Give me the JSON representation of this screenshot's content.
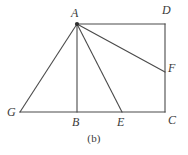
{
  "figure": {
    "caption": "(b)",
    "type": "geometry-diagram",
    "background_color": "#ffffff",
    "stroke_color": "#4a4a4a",
    "label_color": "#3a3a3a",
    "points": {
      "A": {
        "label": "A",
        "x": 77,
        "y": 24,
        "marked": true
      },
      "B": {
        "label": "B",
        "x": 77,
        "y": 112,
        "marked": false
      },
      "C": {
        "label": "C",
        "x": 165,
        "y": 112,
        "marked": false
      },
      "D": {
        "label": "D",
        "x": 165,
        "y": 24,
        "marked": false
      },
      "E": {
        "label": "E",
        "x": 122,
        "y": 112,
        "marked": false
      },
      "F": {
        "label": "F",
        "x": 165,
        "y": 72,
        "marked": false
      },
      "G": {
        "label": "G",
        "x": 20,
        "y": 112,
        "marked": false
      }
    },
    "segments": [
      {
        "name": "AD",
        "from": "A",
        "to": "D"
      },
      {
        "name": "DC",
        "from": "D",
        "to": "C"
      },
      {
        "name": "CG",
        "from": "C",
        "to": "G"
      },
      {
        "name": "GA",
        "from": "G",
        "to": "A"
      },
      {
        "name": "AB",
        "from": "A",
        "to": "B"
      },
      {
        "name": "AE",
        "from": "A",
        "to": "E"
      },
      {
        "name": "AF",
        "from": "A",
        "to": "F"
      }
    ]
  }
}
